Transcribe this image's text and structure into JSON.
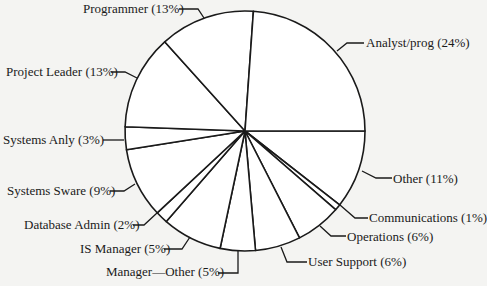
{
  "chart_data": {
    "type": "pie",
    "title": "",
    "center": [
      245,
      131
    ],
    "radius": 120,
    "slices": [
      {
        "label": "Other",
        "percent": 11,
        "start_deg": 0,
        "end_deg": 38,
        "display": "Other (11%)"
      },
      {
        "label": "Communications",
        "percent": 1,
        "start_deg": 38,
        "end_deg": 41,
        "display": "Communications (1%)"
      },
      {
        "label": "Operations",
        "percent": 6,
        "start_deg": 41,
        "end_deg": 63,
        "display": "Operations (6%)"
      },
      {
        "label": "User Support",
        "percent": 6,
        "start_deg": 63,
        "end_deg": 85,
        "display": "User Support (6%)"
      },
      {
        "label": "Manager—Other",
        "percent": 5,
        "start_deg": 85,
        "end_deg": 102,
        "display": "Manager—Other (5%)"
      },
      {
        "label": "IS Manager",
        "percent": 5,
        "start_deg": 102,
        "end_deg": 131,
        "display": "IS Manager (5%)"
      },
      {
        "label": "Database Admin",
        "percent": 2,
        "start_deg": 131,
        "end_deg": 137,
        "display": "Database Admin (2%)"
      },
      {
        "label": "Systems Sware",
        "percent": 9,
        "start_deg": 137,
        "end_deg": 171,
        "display": "Systems Sware (9%)"
      },
      {
        "label": "Systems Anly",
        "percent": 3,
        "start_deg": 171,
        "end_deg": 182,
        "display": "Systems Anly (3%)"
      },
      {
        "label": "Project Leader",
        "percent": 13,
        "start_deg": 182,
        "end_deg": 228,
        "display": "Project Leader (13%)"
      },
      {
        "label": "Programmer",
        "percent": 13,
        "start_deg": 228,
        "end_deg": 274,
        "display": "Programmer (13%)"
      },
      {
        "label": "Analyst/prog",
        "percent": 24,
        "start_deg": 274,
        "end_deg": 360,
        "display": "Analyst/prog (24%)"
      }
    ],
    "legend": "none (leader-line labels)"
  },
  "labels": [
    {
      "key": "programmer",
      "text": "Programmer (13%)",
      "x": 83,
      "y": 1,
      "leader": "M179,9 L198,9 L204,18"
    },
    {
      "key": "analyst",
      "text": "Analyst/prog (24%)",
      "x": 366,
      "y": 35,
      "leader": "M364,43 L347,43 L337,51"
    },
    {
      "key": "project_leader",
      "text": "Project Leader (13%)",
      "x": 6,
      "y": 64,
      "leader": "M111,72 L125,72 L137,78"
    },
    {
      "key": "systems_anly",
      "text": "Systems Anly (3%)",
      "x": 3,
      "y": 132,
      "leader": "M103,140 L124,140"
    },
    {
      "key": "systems_sware",
      "text": "Systems Sware (9%)",
      "x": 7,
      "y": 183,
      "leader": "M110,191 L124,191 L135,184"
    },
    {
      "key": "database_admin",
      "text": "Database Admin (2%)",
      "x": 24,
      "y": 217,
      "leader": "M133,225 L144,225 L157,213"
    },
    {
      "key": "is_manager",
      "text": "IS Manager (5%)",
      "x": 80,
      "y": 241,
      "leader": "M164,249 L182,249 L190,237"
    },
    {
      "key": "manager_other",
      "text": "Manager—Other (5%)",
      "x": 106,
      "y": 264,
      "leader": "M218,273 L238,273 L238,251"
    },
    {
      "key": "user_support",
      "text": "User Support (6%)",
      "x": 308,
      "y": 254,
      "leader": "M307,262 L287,262 L281,247"
    },
    {
      "key": "operations",
      "text": "Operations (6%)",
      "x": 347,
      "y": 229,
      "leader": "M346,236 L331,236 L320,226"
    },
    {
      "key": "communications",
      "text": "Communications (1%)",
      "x": 369,
      "y": 210,
      "leader": "M368,218 L355,218 L340,205"
    },
    {
      "key": "other",
      "text": "Other (11%)",
      "x": 393,
      "y": 171,
      "leader": "M392,178 L376,178 L362,171"
    }
  ],
  "colors": {
    "line": "#1a1a1a",
    "fill": "#ffffff",
    "background": "#f4f4f2"
  }
}
